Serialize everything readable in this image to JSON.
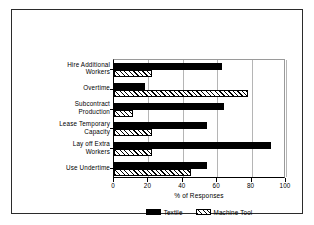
{
  "chart_data": {
    "type": "bar",
    "orientation": "horizontal",
    "title": "",
    "xlabel": "% of Responses",
    "ylabel": "",
    "xlim": [
      0,
      100
    ],
    "xticks": [
      0,
      20,
      40,
      60,
      80,
      100
    ],
    "xtick_labels": [
      "0",
      "20",
      "40",
      "60",
      "80",
      "100"
    ],
    "grid": true,
    "grid_axis": "x",
    "legend_position": "bottom-center",
    "categories": [
      "Hire Additional\nWorkers",
      "Overtime",
      "Subcontract\nProduction",
      "Lease Temporary\nCapacity",
      "Lay off Extra\nWorkers",
      "Use Undertime"
    ],
    "category_lines": [
      [
        "Hire Additional",
        "Workers"
      ],
      [
        "Overtime"
      ],
      [
        "Subcontract",
        "Production"
      ],
      [
        "Lease Temporary",
        "Capacity"
      ],
      [
        "Lay off Extra",
        "Workers"
      ],
      [
        "Use Undertime"
      ]
    ],
    "series": [
      {
        "name": "Textile",
        "fill": "solid-black",
        "color": "#000000",
        "values": [
          63,
          18,
          64,
          54,
          91,
          54
        ]
      },
      {
        "name": "Machine Tool",
        "fill": "diagonal-hatch",
        "color": "#000000",
        "values": [
          22,
          78,
          11,
          22,
          22,
          45
        ]
      }
    ]
  }
}
